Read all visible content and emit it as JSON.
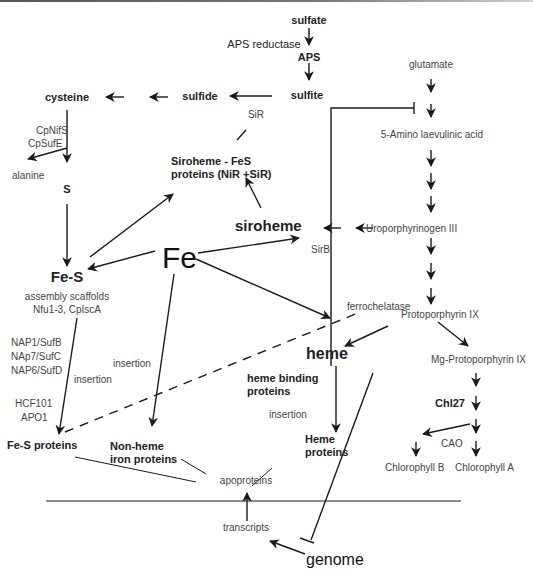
{
  "diagram": {
    "nodes": {
      "sulfate": "sulfate",
      "aps_reductase": "APS reductase",
      "aps": "APS",
      "sulfite": "sulfite",
      "sulfide": "sulfide",
      "sir": "SiR",
      "cysteine": "cysteine",
      "cpnifs": "CpNifS",
      "cpsufe": "CpSufE",
      "alanine": "alanine",
      "s": "S",
      "siroheme_fes_1": "Siroheme - FeS",
      "siroheme_fes_2": "proteins (NiR +SiR)",
      "siroheme": "siroheme",
      "sirb": "SirB",
      "fe": "Fe",
      "fes": "Fe-S",
      "assembly_1": "assembly scaffolds",
      "assembly_2": "Nfu1-3, CpIscA",
      "nap1": "NAP1/SufB",
      "nap7": "NAp7/SufC",
      "nap6": "NAP6/SufD",
      "insertion_left": "insertion",
      "insertion_mid": "insertion",
      "hcf101": "HCF101",
      "apo1": "APO1",
      "fes_proteins": "Fe-S proteins",
      "nonheme_1": "Non-heme",
      "nonheme_2": "iron proteins",
      "glutamate": "glutamate",
      "ala": "5-Amino laevulinic acid",
      "uro": "Uroporphyrinogen III",
      "ferrochelatase": "ferrochelatase",
      "proto": "Protoporphyrin IX",
      "heme": "heme",
      "heme_binding_1": "heme binding",
      "heme_binding_2": "proteins",
      "insertion_heme": "insertion",
      "heme_proteins_1": "Heme",
      "heme_proteins_2": "proteins",
      "mgproto": "Mg-Protoporphyrin IX",
      "chl27": "Chl27",
      "cao": "CAO",
      "chlb": "Chlorophyll B",
      "chla": "Chlorophyll A",
      "apoproteins": "apoproteins",
      "transcripts": "transcripts",
      "genome": "genome"
    },
    "colors": {
      "line": "#1a1a1a",
      "text": "#222222",
      "background": "#ffffff"
    }
  }
}
